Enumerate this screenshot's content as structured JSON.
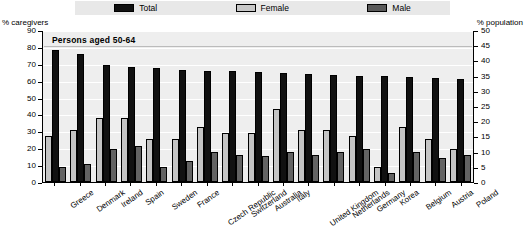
{
  "legend": {
    "items": [
      {
        "label": "Total",
        "color": "#111111",
        "name": "legend-total"
      },
      {
        "label": "Female",
        "color": "#c8c8c8",
        "name": "legend-female"
      },
      {
        "label": "Male",
        "color": "#5a5a5a",
        "name": "legend-male"
      }
    ]
  },
  "axes": {
    "left_caption": "% caregivers",
    "right_caption": "% population",
    "left_ticks": [
      "90",
      "80",
      "70",
      "60",
      "50",
      "40",
      "30",
      "20",
      "10",
      "0"
    ],
    "right_ticks": [
      "50",
      "45",
      "40",
      "35",
      "30",
      "25",
      "20",
      "15",
      "10",
      "5",
      "0"
    ]
  },
  "annotation": "Persons aged 50-64",
  "chart_data": {
    "type": "bar",
    "title": "Persons aged 50-64",
    "xlabel": "",
    "ylabel": "% caregivers",
    "ylabel_secondary": "% population",
    "ylim": [
      0,
      90
    ],
    "ylim_secondary": [
      0,
      50
    ],
    "ytick_step": 10,
    "ytick_step_secondary": 5,
    "grid": true,
    "legend_position": "top",
    "categories": [
      "Greece",
      "Denmark",
      "Ireland",
      "Spain",
      "Sweden",
      "France",
      "Czech Republic",
      "Switzerland",
      "Australia",
      "Italy",
      "United Kingdom",
      "Netherlands",
      "Germany",
      "Korea",
      "Belgium",
      "Austria",
      "Poland"
    ],
    "series": [
      {
        "name": "Female",
        "axis": "right",
        "color": "#c4c4c4",
        "values": [
          15,
          17,
          21,
          21,
          14,
          14,
          18,
          16,
          16,
          24,
          17,
          17,
          15,
          5,
          18,
          14,
          11
        ]
      },
      {
        "name": "Total",
        "axis": "left",
        "color": "#111111",
        "values": [
          78,
          76,
          69,
          68,
          67.5,
          66.5,
          66,
          65.5,
          65,
          64.5,
          64,
          63.5,
          63,
          62.5,
          62,
          61.5,
          61
        ]
      },
      {
        "name": "Male",
        "axis": "right",
        "color": "#636363",
        "values": [
          5,
          6,
          11,
          12,
          5,
          7,
          10,
          9,
          8.5,
          10,
          9,
          10,
          11,
          3,
          10,
          8,
          9
        ]
      }
    ]
  }
}
